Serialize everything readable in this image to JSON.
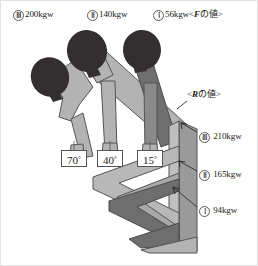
{
  "figure": {
    "title_hidden": "",
    "top_labels": [
      {
        "numeral": "Ⅲ",
        "value": "200kgw"
      },
      {
        "numeral": "Ⅱ",
        "value": "140kgw"
      },
      {
        "numeral": "Ⅰ",
        "value": "56kgw"
      }
    ],
    "top_caption_open": "<",
    "top_caption_symbol": "F",
    "top_caption_rest": "の値>",
    "right_caption_open": "<",
    "right_caption_symbol": "R",
    "right_caption_rest": "の値>",
    "right_labels": [
      {
        "numeral": "Ⅲ",
        "value": "210kgw"
      },
      {
        "numeral": "Ⅱ",
        "value": "165kgw"
      },
      {
        "numeral": "Ⅰ",
        "value": "94kgw"
      }
    ],
    "angles": [
      "70",
      "40",
      "15"
    ],
    "degree_symbol": "°",
    "colors": {
      "body_light": "#b3b3b3",
      "body_dark": "#8a8a8a",
      "body_darkest": "#6e6e6e",
      "head": "#332f30",
      "outline": "#4d4d4d",
      "background": "#ffffff",
      "frame": "#e2e2e2",
      "arrow": "#2b2b2b"
    }
  }
}
